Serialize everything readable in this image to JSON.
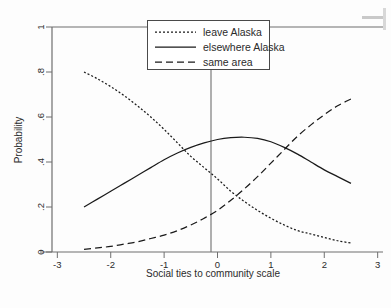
{
  "chart_data": {
    "type": "line",
    "title": "",
    "xlabel": "Social ties to community scale",
    "ylabel": "Probability",
    "xlim": [
      -3.1,
      3.1
    ],
    "ylim": [
      0,
      1
    ],
    "xticks": [
      -3,
      -2,
      -1,
      0,
      1,
      2,
      3
    ],
    "xtick_labels": [
      "-3",
      "-2",
      "-1",
      "0",
      "1",
      "2",
      "3"
    ],
    "yticks": [
      0,
      0.2,
      0.4,
      0.6,
      0.8,
      1
    ],
    "ytick_labels": [
      "0",
      ".2",
      ".4",
      ".6",
      ".8",
      "1"
    ],
    "grid": false,
    "legend_position": "top-center",
    "reference_line_x": 0,
    "series": [
      {
        "name": "leave Alaska",
        "style": "dotted",
        "color": "#1a1a1a",
        "x": [
          -2.5,
          -2.25,
          -2.0,
          -1.75,
          -1.5,
          -1.25,
          -1.0,
          -0.75,
          -0.5,
          -0.25,
          0.0,
          0.25,
          0.5,
          0.75,
          1.0,
          1.25,
          1.5,
          1.75,
          2.0,
          2.25,
          2.5
        ],
        "values": [
          0.8,
          0.77,
          0.735,
          0.695,
          0.65,
          0.6,
          0.545,
          0.485,
          0.425,
          0.375,
          0.325,
          0.27,
          0.225,
          0.185,
          0.15,
          0.12,
          0.095,
          0.08,
          0.065,
          0.05,
          0.04
        ]
      },
      {
        "name": "elsewhere Alaska",
        "style": "solid",
        "color": "#1a1a1a",
        "x": [
          -2.5,
          -2.25,
          -2.0,
          -1.75,
          -1.5,
          -1.25,
          -1.0,
          -0.75,
          -0.5,
          -0.25,
          0.0,
          0.25,
          0.5,
          0.75,
          1.0,
          1.25,
          1.5,
          1.75,
          2.0,
          2.25,
          2.5
        ],
        "values": [
          0.2,
          0.235,
          0.27,
          0.305,
          0.34,
          0.375,
          0.41,
          0.44,
          0.465,
          0.485,
          0.5,
          0.508,
          0.51,
          0.505,
          0.49,
          0.465,
          0.435,
          0.4,
          0.365,
          0.335,
          0.305
        ]
      },
      {
        "name": "same area",
        "style": "dashed",
        "color": "#1a1a1a",
        "x": [
          -2.5,
          -2.25,
          -2.0,
          -1.75,
          -1.5,
          -1.25,
          -1.0,
          -0.75,
          -0.5,
          -0.25,
          0.0,
          0.25,
          0.5,
          0.75,
          1.0,
          1.25,
          1.5,
          1.75,
          2.0,
          2.25,
          2.5
        ],
        "values": [
          0.012,
          0.018,
          0.025,
          0.035,
          0.045,
          0.06,
          0.075,
          0.095,
          0.12,
          0.15,
          0.185,
          0.23,
          0.28,
          0.335,
          0.395,
          0.455,
          0.515,
          0.565,
          0.61,
          0.65,
          0.68
        ]
      }
    ],
    "legend": [
      {
        "label": "leave Alaska",
        "style": "dotted"
      },
      {
        "label": "elsewhere Alaska",
        "style": "solid"
      },
      {
        "label": "same area",
        "style": "dashed"
      }
    ]
  }
}
